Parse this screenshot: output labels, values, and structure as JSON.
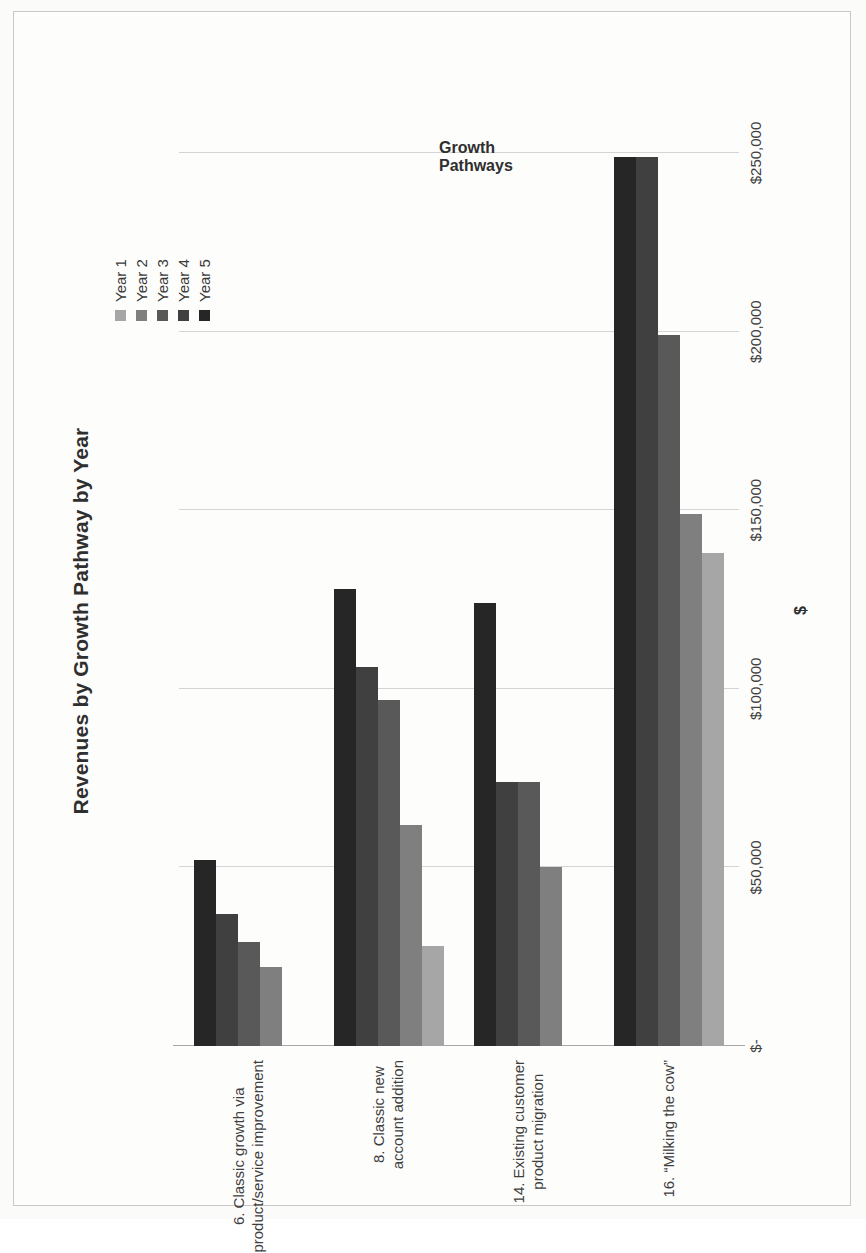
{
  "chart_data": {
    "type": "bar",
    "orientation": "horizontal",
    "title": "Revenues by Growth Pathway by Year",
    "xlabel": "Growth Pathways",
    "ylabel": "$",
    "grid": true,
    "legend_position": "top-right",
    "axis_tick_labels": [
      "$-",
      "$50,000",
      "$100,000",
      "$150,000",
      "$200,000",
      "$250,000"
    ],
    "axis_tick_values": [
      0,
      50000,
      100000,
      150000,
      200000,
      250000
    ],
    "value_axis_range": [
      0,
      250000
    ],
    "categories": [
      "6. Classic growth via product/service improvement",
      "8. Classic new account addition",
      "14. Existing customer product migration",
      "16. “Milking the cow”"
    ],
    "category_lines": [
      [
        "6. Classic growth via",
        "product/service improvement"
      ],
      [
        "8. Classic new",
        "account addition"
      ],
      [
        "14. Existing customer",
        "product migration"
      ],
      [
        "16. “Milking the cow”"
      ]
    ],
    "series": [
      {
        "name": "Year 1",
        "color": "#a6a6a6",
        "values": [
          0,
          28000,
          0,
          138000
        ]
      },
      {
        "name": "Year 2",
        "color": "#7f7f7f",
        "values": [
          22000,
          62000,
          50000,
          149000
        ]
      },
      {
        "name": "Year 3",
        "color": "#595959",
        "values": [
          29000,
          97000,
          74000,
          199000
        ]
      },
      {
        "name": "Year 4",
        "color": "#404040",
        "values": [
          37000,
          106000,
          74000,
          249000
        ]
      },
      {
        "name": "Year 5",
        "color": "#262626",
        "values": [
          52000,
          128000,
          124000,
          249000
        ]
      }
    ]
  },
  "legend": {
    "items": [
      {
        "label": "Year 1",
        "color": "#a6a6a6"
      },
      {
        "label": "Year 2",
        "color": "#7f7f7f"
      },
      {
        "label": "Year 3",
        "color": "#595959"
      },
      {
        "label": "Year 4",
        "color": "#404040"
      },
      {
        "label": "Year 5",
        "color": "#262626"
      }
    ]
  }
}
